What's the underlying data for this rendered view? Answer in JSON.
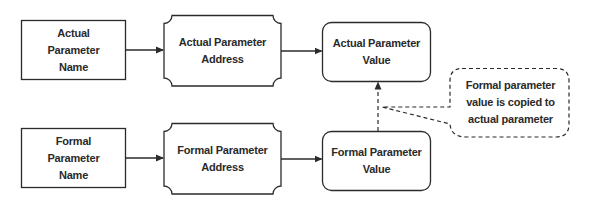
{
  "diagram": {
    "colors": {
      "stroke": "#2b2b2b",
      "text": "#2a2a2a",
      "background": "#ffffff"
    },
    "nodes": {
      "actual_name": {
        "label": "Actual\nParameter\nName",
        "shape": "rectangle"
      },
      "actual_address": {
        "label": "Actual Parameter\nAddress",
        "shape": "concave-corner-rectangle"
      },
      "actual_value": {
        "label": "Actual Parameter\nValue",
        "shape": "rounded-rectangle"
      },
      "formal_name": {
        "label": "Formal\nParameter\nName",
        "shape": "rectangle"
      },
      "formal_address": {
        "label": "Formal Parameter\nAddress",
        "shape": "concave-corner-rectangle"
      },
      "formal_value": {
        "label": "Formal Parameter\nValue",
        "shape": "rounded-rectangle"
      },
      "callout": {
        "label": "Formal parameter\nvalue is copied to\nactual parameter",
        "shape": "dashed-callout"
      }
    },
    "edges": [
      {
        "from": "actual_name",
        "to": "actual_address",
        "style": "solid"
      },
      {
        "from": "actual_address",
        "to": "actual_value",
        "style": "solid"
      },
      {
        "from": "formal_name",
        "to": "formal_address",
        "style": "solid"
      },
      {
        "from": "formal_address",
        "to": "formal_value",
        "style": "solid"
      },
      {
        "from": "formal_value",
        "to": "actual_value",
        "style": "dashed"
      }
    ]
  }
}
